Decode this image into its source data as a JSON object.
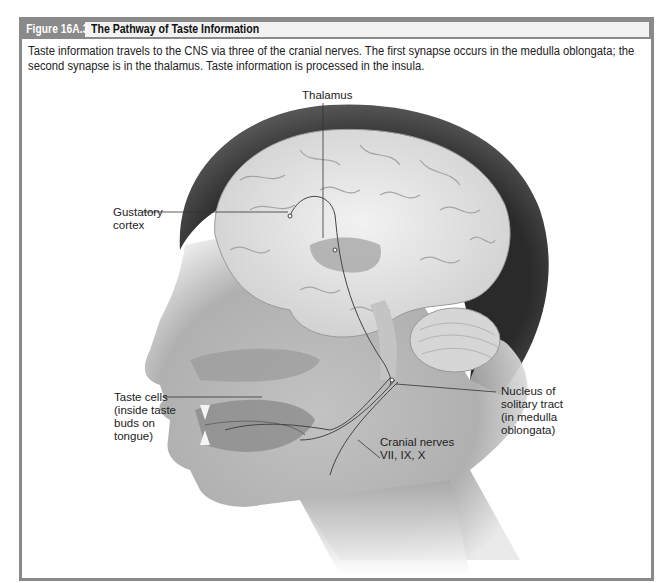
{
  "figure": {
    "number_label": "Figure 16A.3",
    "title": "The Pathway of Taste Information",
    "caption": "Taste information travels to the CNS via three of the cranial nerves. The first synapse occurs in the medulla oblongata; the second synapse is in the thalamus. Taste information is processed in the insula.",
    "header_color": "#8a8a8a",
    "title_bg_color": "#f2f2f2"
  },
  "illustration": {
    "subject": "sagittal-head-brain-taste-pathway",
    "labels": {
      "thalamus": "Thalamus",
      "gustatory_cortex_line1": "Gustatory",
      "gustatory_cortex_line2": "cortex",
      "taste_cells_line1": "Taste cells",
      "taste_cells_line2": "(inside taste",
      "taste_cells_line3": "buds on",
      "taste_cells_line4": "tongue)",
      "cranial_nerves_line1": "Cranial nerves",
      "cranial_nerves_line2": "VII, IX, X",
      "nucleus_line1": "Nucleus of",
      "nucleus_line2": "solitary tract",
      "nucleus_line3": "(in medulla",
      "nucleus_line4": "oblongata)"
    }
  }
}
